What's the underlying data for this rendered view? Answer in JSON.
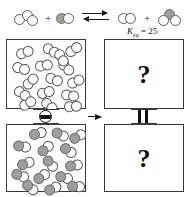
{
  "figure": {
    "type": "chemistry-equilibrium-diagram",
    "equilibrium_constant": {
      "symbol": "K",
      "subscript": "eq",
      "relation": "=",
      "value": "25",
      "full_text": "Keq = 25"
    },
    "equation": {
      "reactants": [
        {
          "id": "A3",
          "name": "triatomic-white-cluster",
          "atoms": [
            {
              "fill": "white"
            },
            {
              "fill": "white"
            },
            {
              "fill": "white"
            }
          ]
        },
        {
          "id": "BA",
          "name": "gray-white-diatomic",
          "atoms": [
            {
              "fill": "gray"
            },
            {
              "fill": "white"
            }
          ]
        }
      ],
      "products": [
        {
          "id": "A2",
          "name": "white-diatomic",
          "atoms": [
            {
              "fill": "white"
            },
            {
              "fill": "white"
            }
          ]
        },
        {
          "id": "A2B",
          "name": "cluster-with-gray",
          "atoms": [
            {
              "fill": "gray"
            },
            {
              "fill": "white"
            },
            {
              "fill": "white"
            }
          ]
        }
      ],
      "operator_plus": "+",
      "arrow": "equilibrium-double-harpoon"
    },
    "colors": {
      "white_atom": "#ffffff",
      "gray_atom": "#9e9e9e",
      "outline": "#5a5a5a",
      "vessel_border": "#3a3a3a",
      "ink": "#1a1a1a",
      "valve": "#111111"
    },
    "panels": {
      "left": {
        "label": "initial-state",
        "valve_state": "closed",
        "top_vessel": {
          "label": "top-left-vessel",
          "contents": "white molecules",
          "molecule_count": 16,
          "molecules": [
            {
              "x": 9,
              "y": 7,
              "r": -20,
              "atoms": [
                "white",
                "white"
              ]
            },
            {
              "x": 35,
              "y": 5,
              "r": 30,
              "atoms": [
                "white",
                "white"
              ]
            },
            {
              "x": 58,
              "y": 4,
              "r": -35,
              "atoms": [
                "white",
                "white"
              ]
            },
            {
              "x": 5,
              "y": 23,
              "r": 15,
              "atoms": [
                "white",
                "white"
              ]
            },
            {
              "x": 28,
              "y": 20,
              "r": -10,
              "atoms": [
                "white",
                "white"
              ]
            },
            {
              "x": 50,
              "y": 22,
              "r": 45,
              "atoms": [
                "white",
                "white"
              ]
            },
            {
              "x": 15,
              "y": 36,
              "r": -45,
              "atoms": [
                "white",
                "white"
              ]
            },
            {
              "x": 38,
              "y": 34,
              "r": 20,
              "atoms": [
                "white",
                "white"
              ]
            },
            {
              "x": 60,
              "y": 36,
              "r": -25,
              "atoms": [
                "white",
                "white"
              ]
            },
            {
              "x": 6,
              "y": 48,
              "r": 35,
              "atoms": [
                "white",
                "white"
              ]
            },
            {
              "x": 30,
              "y": 47,
              "r": -15,
              "atoms": [
                "white",
                "white"
              ]
            },
            {
              "x": 54,
              "y": 50,
              "r": 10,
              "atoms": [
                "white",
                "white"
              ]
            },
            {
              "x": 12,
              "y": 58,
              "r": -30,
              "atoms": [
                "white",
                "white"
              ]
            },
            {
              "x": 33,
              "y": 60,
              "r": 40,
              "atoms": [
                "white",
                "white"
              ]
            },
            {
              "x": 57,
              "y": 61,
              "r": -5,
              "atoms": [
                "white",
                "white"
              ]
            },
            {
              "x": 45,
              "y": 12,
              "r": 60,
              "atoms": [
                "white",
                "white"
              ]
            }
          ]
        },
        "bottom_vessel": {
          "label": "bottom-left-vessel",
          "contents": "gray-white diatomic molecules",
          "molecule_count": 15,
          "molecules": [
            {
              "x": 22,
              "y": 3,
              "r": -15,
              "atoms": [
                "gray",
                "white"
              ]
            },
            {
              "x": 44,
              "y": 4,
              "r": 25,
              "atoms": [
                "gray",
                "white"
              ]
            },
            {
              "x": 62,
              "y": 6,
              "r": -30,
              "atoms": [
                "gray",
                "white"
              ]
            },
            {
              "x": 6,
              "y": 16,
              "r": 10,
              "atoms": [
                "gray",
                "white"
              ]
            },
            {
              "x": 30,
              "y": 18,
              "r": -40,
              "atoms": [
                "gray",
                "white"
              ]
            },
            {
              "x": 52,
              "y": 20,
              "r": 35,
              "atoms": [
                "gray",
                "white"
              ]
            },
            {
              "x": 10,
              "y": 33,
              "r": -20,
              "atoms": [
                "gray",
                "white"
              ]
            },
            {
              "x": 34,
              "y": 33,
              "r": 50,
              "atoms": [
                "gray",
                "white"
              ]
            },
            {
              "x": 58,
              "y": 35,
              "r": -10,
              "atoms": [
                "gray",
                "white"
              ]
            },
            {
              "x": 4,
              "y": 45,
              "r": 20,
              "atoms": [
                "gray",
                "white"
              ]
            },
            {
              "x": 26,
              "y": 46,
              "r": -35,
              "atoms": [
                "gray",
                "white"
              ]
            },
            {
              "x": 48,
              "y": 47,
              "r": 15,
              "atoms": [
                "gray",
                "white"
              ]
            },
            {
              "x": 14,
              "y": 57,
              "r": 40,
              "atoms": [
                "gray",
                "white"
              ]
            },
            {
              "x": 37,
              "y": 58,
              "r": -25,
              "atoms": [
                "gray",
                "white"
              ]
            },
            {
              "x": 60,
              "y": 56,
              "r": 5,
              "atoms": [
                "gray",
                "white"
              ]
            }
          ]
        }
      },
      "right": {
        "label": "final-state-unknown",
        "valve_state": "open",
        "top_vessel": {
          "label": "top-right-vessel",
          "contents_text": "?"
        },
        "bottom_vessel": {
          "label": "bottom-right-vessel",
          "contents_text": "?"
        }
      },
      "process_arrow": "→"
    }
  }
}
